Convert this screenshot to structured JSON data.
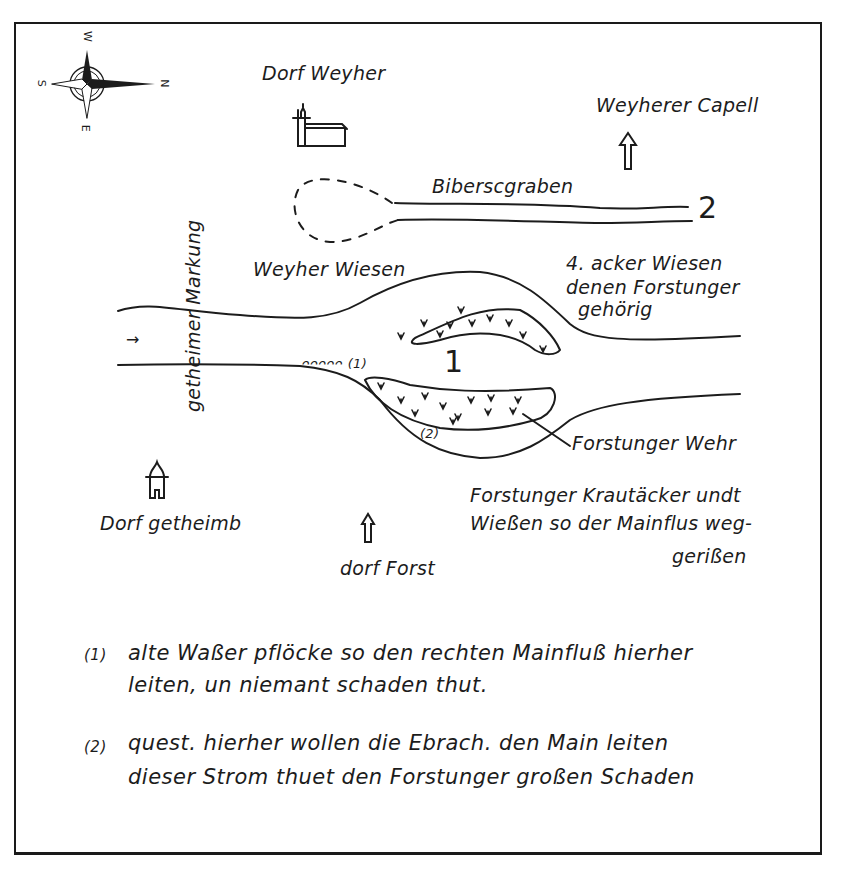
{
  "map": {
    "compass": {
      "north": "N",
      "south": "S",
      "east": "E",
      "west": "W"
    },
    "places": {
      "dorf_weyher": "Dorf Weyher",
      "weyherer_capell": "Weyherer Capell",
      "dorf_getheimb": "Dorf getheimb",
      "dorf_forst": "dorf Forst"
    },
    "features": {
      "bibersgraben": "Biberscgraben",
      "getheimer_markung": "getheimer Markung",
      "weyher_wiesen": "Weyher Wiesen",
      "acker_wiesen": [
        "4. acker Wiesen",
        "denen Forstunger",
        "gehörig"
      ],
      "forstunger_wehr": "Forstunger Wehr",
      "krautacker": [
        "Forstunger Krautäcker undt",
        "Wießen so der Mainflus weg-",
        "gerißen"
      ],
      "stakes": "ᴖᴖᴖᴖᴖ (1)",
      "marker_2_label": "(2)",
      "flow_arrow": "→"
    },
    "numbers": {
      "one": "1",
      "two": "2"
    }
  },
  "footnotes": [
    {
      "marker": "(1)",
      "lines": [
        "alte Waßer pflöcke so den rechten Mainfluß hierher",
        "leiten, un niemant schaden thut."
      ]
    },
    {
      "marker": "(2)",
      "lines": [
        "quest. hierher wollen die Ebrach. den Main leiten",
        "dieser Strom thuet den Forstunger großen Schaden"
      ]
    }
  ]
}
